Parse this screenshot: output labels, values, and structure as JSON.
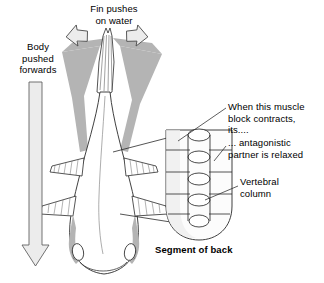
{
  "figure": {
    "background_color": "#ffffff",
    "ink_color": "#000000",
    "body_shade_color": "#b0b0b0",
    "arrow_fill_color": "#e8e8e8"
  },
  "labels": {
    "fin_pushes": "Fin pushes\non water",
    "body_pushed": "Body\npushed\nforwards",
    "muscle_contracts": "When this muscle\nblock contracts,\nits....",
    "antagonistic": "... antagonistic\npartner is relaxed",
    "vertebral_column": "Vertebral\ncolumn",
    "segment_of_back": "Segment of back"
  },
  "arrows": {
    "fin_left": {
      "name": "fin-push-arrow-left",
      "direction": "up-left"
    },
    "fin_right": {
      "name": "fin-push-arrow-right",
      "direction": "up-right"
    },
    "body_forward": {
      "name": "body-forward-arrow",
      "direction": "down"
    }
  },
  "fish": {
    "view": "dorsal",
    "parts": [
      "caudal-fin",
      "body",
      "pectoral-fin-left",
      "pectoral-fin-right",
      "pelvic-fin-left",
      "pelvic-fin-right",
      "head",
      "eye-left",
      "eye-right"
    ]
  },
  "segment": {
    "name": "segment-of-back",
    "muscle_block_rows": 4,
    "vertebrae_count": 5,
    "has_vertebral_column": true
  },
  "leader_lines": [
    {
      "name": "leader-muscle-contracts",
      "from": "muscle_contracts",
      "to": "muscle-block-upper"
    },
    {
      "name": "leader-antagonistic",
      "from": "antagonistic",
      "to": "muscle-block-opposite"
    },
    {
      "name": "leader-vertebral",
      "from": "vertebral_column",
      "to": "vertebral-column"
    }
  ],
  "magnification_lines": {
    "name": "magnification-guides",
    "from": "fish-body-midsection",
    "to": "segment-of-back"
  }
}
